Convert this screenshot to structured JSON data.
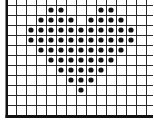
{
  "diagram": {
    "type": "dot-grid-pattern",
    "shape": "heart",
    "colors": {
      "background": "#ffffff",
      "grid_line": "#2a2a2a",
      "border": "#111111",
      "dot": "#111111"
    },
    "grid": {
      "origin_x": 6,
      "origin_y": 5,
      "cell_size": 10,
      "columns": 15,
      "rows": 11
    },
    "dots": [
      [
        4,
        0
      ],
      [
        5,
        0
      ],
      [
        9,
        0
      ],
      [
        10,
        0
      ],
      [
        3,
        1
      ],
      [
        4,
        1
      ],
      [
        5,
        1
      ],
      [
        6,
        1
      ],
      [
        8,
        1
      ],
      [
        9,
        1
      ],
      [
        10,
        1
      ],
      [
        11,
        1
      ],
      [
        2,
        2
      ],
      [
        3,
        2
      ],
      [
        4,
        2
      ],
      [
        5,
        2
      ],
      [
        6,
        2
      ],
      [
        7,
        2
      ],
      [
        8,
        2
      ],
      [
        9,
        2
      ],
      [
        10,
        2
      ],
      [
        11,
        2
      ],
      [
        12,
        2
      ],
      [
        2,
        3
      ],
      [
        3,
        3
      ],
      [
        4,
        3
      ],
      [
        5,
        3
      ],
      [
        6,
        3
      ],
      [
        7,
        3
      ],
      [
        8,
        3
      ],
      [
        9,
        3
      ],
      [
        10,
        3
      ],
      [
        11,
        3
      ],
      [
        12,
        3
      ],
      [
        3,
        4
      ],
      [
        4,
        4
      ],
      [
        5,
        4
      ],
      [
        6,
        4
      ],
      [
        7,
        4
      ],
      [
        8,
        4
      ],
      [
        9,
        4
      ],
      [
        10,
        4
      ],
      [
        11,
        4
      ],
      [
        4,
        5
      ],
      [
        5,
        5
      ],
      [
        6,
        5
      ],
      [
        7,
        5
      ],
      [
        8,
        5
      ],
      [
        9,
        5
      ],
      [
        10,
        5
      ],
      [
        5,
        6
      ],
      [
        6,
        6
      ],
      [
        7,
        6
      ],
      [
        8,
        6
      ],
      [
        9,
        6
      ],
      [
        6,
        7
      ],
      [
        7,
        7
      ],
      [
        8,
        7
      ],
      [
        7,
        8
      ]
    ]
  }
}
